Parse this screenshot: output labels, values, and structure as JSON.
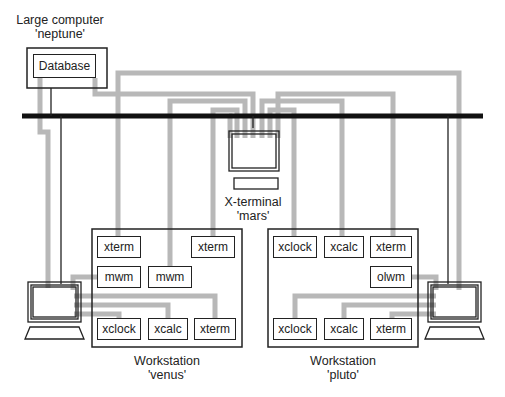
{
  "colors": {
    "wire": "#b8b8b8",
    "network": "#111111",
    "outline": "#222222"
  },
  "neptune": {
    "caption_line1": "Large computer",
    "caption_line2": "'neptune'",
    "app": "Database"
  },
  "mars": {
    "caption_line1": "X-terminal",
    "caption_line2": "'mars'"
  },
  "venus": {
    "caption_line1": "Workstation",
    "caption_line2": "'venus'",
    "apps": [
      "xterm",
      "xterm",
      "mwm",
      "mwm",
      "xclock",
      "xcalc",
      "xterm"
    ]
  },
  "pluto": {
    "caption_line1": "Workstation",
    "caption_line2": "'pluto'",
    "apps": [
      "xclock",
      "xcalc",
      "xterm",
      "olwm",
      "xclock",
      "xcalc",
      "xterm"
    ]
  }
}
